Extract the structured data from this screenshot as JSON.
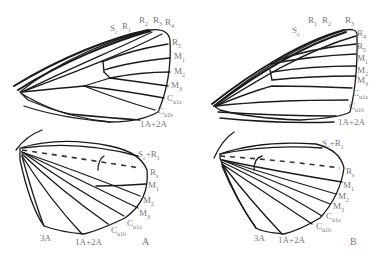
{
  "figure": {
    "panels": [
      {
        "id": "A",
        "label": "A",
        "forewing_labels": [
          {
            "base": "S",
            "sub": "c",
            "x": 110,
            "y": 24
          },
          {
            "base": "R",
            "sub": "1",
            "x": 122,
            "y": 22
          },
          {
            "base": "R",
            "sub": "2",
            "x": 139,
            "y": 16
          },
          {
            "base": "R",
            "sub": "3",
            "x": 153,
            "y": 16
          },
          {
            "base": "R",
            "sub": "4",
            "x": 165,
            "y": 18
          },
          {
            "base": "R",
            "sub": "5",
            "x": 172,
            "y": 38
          },
          {
            "base": "M",
            "sub": "1",
            "x": 174,
            "y": 52
          },
          {
            "base": "M",
            "sub": "2",
            "x": 174,
            "y": 67
          },
          {
            "base": "M",
            "sub": "3",
            "x": 171,
            "y": 81
          },
          {
            "base": "C",
            "sub": "u1a",
            "x": 167,
            "y": 94
          },
          {
            "base": "C",
            "sub": "u1b",
            "x": 158,
            "y": 107
          },
          {
            "base": "1A+2A",
            "sub": "",
            "x": 140,
            "y": 120
          }
        ],
        "hindwing_labels": [
          {
            "base": "S",
            "sub": "c",
            "extra": "+R",
            "sub2": "1",
            "x": 138,
            "y": 150
          },
          {
            "base": "R",
            "sub": "s",
            "x": 150,
            "y": 168
          },
          {
            "base": "M",
            "sub": "1",
            "x": 148,
            "y": 181
          },
          {
            "base": "M",
            "sub": "2",
            "x": 143,
            "y": 196
          },
          {
            "base": "M",
            "sub": "3",
            "x": 139,
            "y": 209
          },
          {
            "base": "C",
            "sub": "u1a",
            "x": 127,
            "y": 219
          },
          {
            "base": "C",
            "sub": "u1b",
            "x": 111,
            "y": 226
          },
          {
            "base": "3A",
            "sub": "",
            "x": 40,
            "y": 234
          },
          {
            "base": "1A+2A",
            "sub": "",
            "x": 75,
            "y": 238
          }
        ],
        "panel_label_pos": {
          "x": 142,
          "y": 236
        }
      },
      {
        "id": "B",
        "label": "B",
        "forewing_labels": [
          {
            "base": "S",
            "sub": "c",
            "x": 292,
            "y": 26
          },
          {
            "base": "R",
            "sub": "1",
            "x": 308,
            "y": 16
          },
          {
            "base": "R",
            "sub": "2",
            "x": 322,
            "y": 16
          },
          {
            "base": "R",
            "sub": "3",
            "x": 345,
            "y": 16
          },
          {
            "base": "R",
            "sub": "4",
            "x": 357,
            "y": 29
          },
          {
            "base": "R",
            "sub": "5",
            "x": 357,
            "y": 42
          },
          {
            "base": "M",
            "sub": "1",
            "x": 357,
            "y": 54
          },
          {
            "base": "M",
            "sub": "2",
            "x": 357,
            "y": 66
          },
          {
            "base": "M",
            "sub": "3",
            "x": 357,
            "y": 76
          },
          {
            "base": "C",
            "sub": "u1a",
            "x": 353,
            "y": 89
          },
          {
            "base": "C",
            "sub": "u1b",
            "x": 349,
            "y": 102
          },
          {
            "base": "1A+2A",
            "sub": "",
            "x": 338,
            "y": 118
          }
        ],
        "hindwing_labels": [
          {
            "base": "S",
            "sub": "c",
            "extra": "+R",
            "sub2": "1",
            "x": 322,
            "y": 139
          },
          {
            "base": "R",
            "sub": "s",
            "x": 346,
            "y": 167
          },
          {
            "base": "M",
            "sub": "1",
            "x": 343,
            "y": 181
          },
          {
            "base": "M",
            "sub": "2",
            "x": 338,
            "y": 192
          },
          {
            "base": "M",
            "sub": "3",
            "x": 333,
            "y": 202
          },
          {
            "base": "C",
            "sub": "u1a",
            "x": 326,
            "y": 212
          },
          {
            "base": "C",
            "sub": "u1b",
            "x": 316,
            "y": 222
          },
          {
            "base": "3A",
            "sub": "",
            "x": 254,
            "y": 234
          },
          {
            "base": "1A+2A",
            "sub": "",
            "x": 278,
            "y": 236
          }
        ],
        "panel_label_pos": {
          "x": 350,
          "y": 236
        }
      }
    ]
  }
}
